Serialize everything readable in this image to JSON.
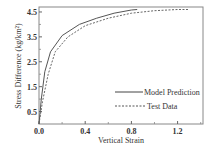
{
  "chart_data": {
    "type": "line",
    "title": "",
    "xlabel": "Vertical Strain",
    "ylabel": "Stress Difference (kg/km²)",
    "xlim": [
      0.0,
      1.42
    ],
    "ylim": [
      0.0,
      4.7
    ],
    "x_ticks": [
      0.0,
      0.4,
      0.8,
      1.2
    ],
    "x_tick_labels": [
      "0.0",
      "0.4",
      "0.8",
      "1.2"
    ],
    "x_minor_ticks": [
      0.2,
      0.6,
      1.0,
      1.4
    ],
    "y_ticks": [
      0.5,
      1.5,
      2.5,
      3.5,
      4.5
    ],
    "y_tick_labels": [
      "0.5",
      "1.5",
      "2.5",
      "3.5",
      "4.5"
    ],
    "y_minor_ticks": [
      1.0,
      2.0,
      3.0,
      4.0
    ],
    "grid": false,
    "legend_position": "lower right",
    "series": [
      {
        "name": "Model Prediction",
        "style": "solid",
        "color": "#555555",
        "x": [
          0.0,
          0.02,
          0.05,
          0.1,
          0.2,
          0.35,
          0.5,
          0.65,
          0.8,
          0.85
        ],
        "y": [
          0.0,
          1.0,
          2.1,
          2.9,
          3.55,
          4.0,
          4.25,
          4.45,
          4.58,
          4.6
        ]
      },
      {
        "name": "Test Data",
        "style": "dashed",
        "color": "#666666",
        "x": [
          0.0,
          0.03,
          0.08,
          0.14,
          0.25,
          0.4,
          0.6,
          0.8,
          1.0,
          1.2,
          1.3
        ],
        "y": [
          0.0,
          0.9,
          2.0,
          2.9,
          3.5,
          3.95,
          4.25,
          4.45,
          4.55,
          4.6,
          4.6
        ]
      }
    ]
  },
  "legend": {
    "items": [
      {
        "label": "Model Prediction",
        "style": "solid"
      },
      {
        "label": "Test Data",
        "style": "dashed"
      }
    ]
  },
  "axes": {
    "x_label": "Vertical Strain",
    "y_label": "Stress Difference (kg/km²)"
  }
}
